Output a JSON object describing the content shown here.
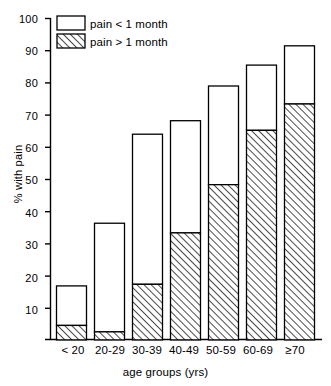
{
  "chart_data": {
    "type": "bar",
    "stacked": true,
    "title": "",
    "subtitle": "",
    "xlabel": "age groups (yrs)",
    "ylabel": "% with pain",
    "categories": [
      "< 20",
      "20-29",
      "30-39",
      "40-49",
      "50-59",
      "60-69",
      "≥70"
    ],
    "series": [
      {
        "name": "pain > 1 month",
        "style": "hatched",
        "values": [
          4.5,
          2.5,
          17.3,
          33.3,
          48.3,
          65.2,
          73.4
        ]
      },
      {
        "name": "pain < 1 month",
        "style": "white",
        "values": [
          12.3,
          33.8,
          46.7,
          34.9,
          30.7,
          20.3,
          18.1
        ]
      }
    ],
    "totals": [
      16.8,
      36.3,
      64.0,
      68.2,
      79.0,
      85.5,
      91.5
    ],
    "ylim": [
      0,
      100
    ],
    "yticks": [
      10,
      20,
      30,
      40,
      50,
      60,
      70,
      80,
      90,
      100
    ],
    "ytick_labels": [
      "10",
      "20",
      "30",
      "40",
      "50",
      "60",
      "70",
      "80",
      "90",
      "100"
    ],
    "grid": false,
    "legend_position": "top-left",
    "legend": [
      {
        "label": "pain < 1 month",
        "style": "white"
      },
      {
        "label": "pain > 1 month",
        "style": "hatched"
      }
    ],
    "axis_color": "#000000",
    "bar_edge_color": "#000000",
    "hatch_color": "#000000",
    "background": "#ffffff"
  }
}
